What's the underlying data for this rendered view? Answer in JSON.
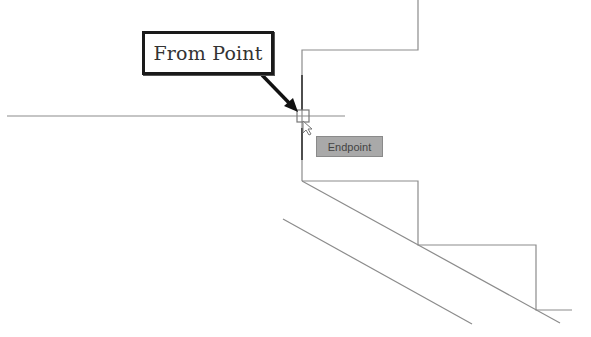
{
  "callout": {
    "label": "From Point"
  },
  "snap_tooltip": {
    "label": "Endpoint"
  },
  "colors": {
    "geometry": "#8c8c8c",
    "callout_border": "#1a1a1a",
    "tooltip_bg": "#a9a9a9"
  },
  "drawing": {
    "crosshair_horizontal": {
      "x1": 7,
      "y1": 116,
      "x2": 345,
      "y2": 116
    },
    "snap_marker": {
      "x": 297,
      "y": 110,
      "size": 12
    }
  }
}
